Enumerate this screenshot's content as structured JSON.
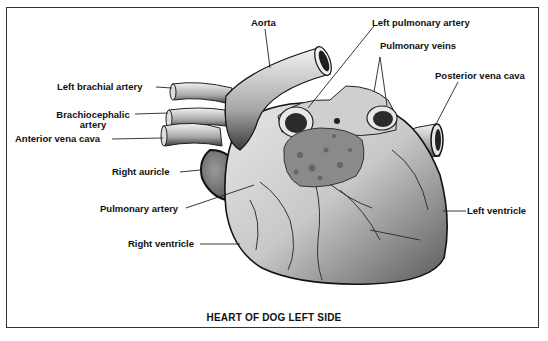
{
  "diagram": {
    "title": "HEART OF DOG LEFT SIDE",
    "labels": {
      "aorta": "Aorta",
      "left_pulmonary_artery": "Left pulmonary artery",
      "pulmonary_veins": "Pulmonary veins",
      "posterior_vena_cava": "Posterior vena cava",
      "left_brachial_artery": "Left brachial artery",
      "brachiocephalic_artery_line1": "Brachiocephalic",
      "brachiocephalic_artery_line2": "artery",
      "anterior_vena_cava": "Anterior vena cava",
      "right_auricle": "Right auricle",
      "pulmonary_artery": "Pulmonary artery",
      "right_ventricle": "Right ventricle",
      "left_ventricle": "Left ventricle"
    },
    "colors": {
      "ink": "#111111",
      "border": "#333333",
      "background": "#ffffff"
    }
  }
}
